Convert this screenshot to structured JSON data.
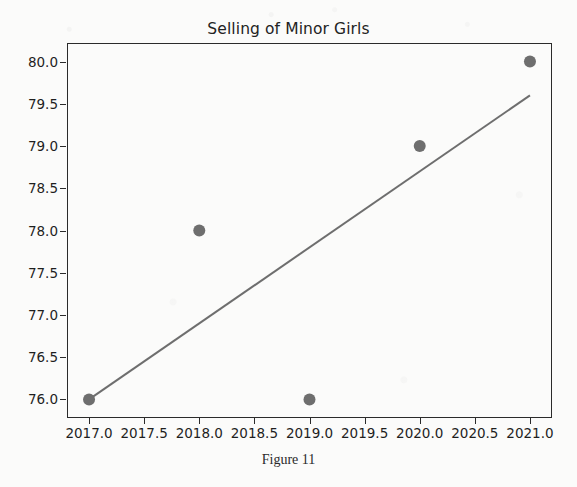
{
  "figure": {
    "caption": "Figure 11",
    "background_color": "#fbfbfa"
  },
  "chart_data": {
    "type": "scatter",
    "title": "Selling of Minor Girls",
    "xlabel": "",
    "ylabel": "",
    "xlim": [
      2016.8,
      2021.2
    ],
    "ylim": [
      75.78,
      80.22
    ],
    "grid": false,
    "legend": null,
    "marker_color": "#6e6e6e",
    "line_color": "#6e6e6e",
    "axis_color": "#2b2b2b",
    "x": [
      2017,
      2018,
      2019,
      2020,
      2021
    ],
    "values": [
      76.0,
      78.0,
      76.0,
      79.0,
      80.0
    ],
    "points": [
      {
        "x": 2017,
        "y": 76.0
      },
      {
        "x": 2018,
        "y": 78.0
      },
      {
        "x": 2019,
        "y": 76.0
      },
      {
        "x": 2020,
        "y": 79.0
      },
      {
        "x": 2021,
        "y": 80.0
      }
    ],
    "trendline": {
      "type": "line",
      "x": [
        2017,
        2021
      ],
      "y": [
        76.0,
        79.6
      ]
    },
    "xticks": [
      2017.0,
      2017.5,
      2018.0,
      2018.5,
      2019.0,
      2019.5,
      2020.0,
      2020.5,
      2021.0
    ],
    "xtick_labels": [
      "2017.0",
      "2017.5",
      "2018.0",
      "2018.5",
      "2019.0",
      "2019.5",
      "2020.0",
      "2020.5",
      "2021.0"
    ],
    "yticks": [
      76.0,
      76.5,
      77.0,
      77.5,
      78.0,
      78.5,
      79.0,
      79.5,
      80.0
    ],
    "ytick_labels": [
      "76.0",
      "76.5",
      "77.0",
      "77.5",
      "78.0",
      "78.5",
      "79.0",
      "79.5",
      "80.0"
    ]
  }
}
